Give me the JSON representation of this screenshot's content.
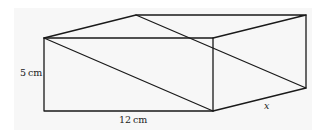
{
  "diagram": {
    "type": "cuboid",
    "labels": {
      "height": "5 cm",
      "length": "12 cm",
      "depth": "x"
    },
    "colors": {
      "stroke": "#1a1a1a",
      "background": "#f7f7f7"
    },
    "vertices": {
      "front_top_left": [
        44,
        38
      ],
      "front_top_right": [
        213,
        38
      ],
      "front_bottom_left": [
        44,
        111
      ],
      "front_bottom_right": [
        213,
        111
      ],
      "back_top_left": [
        136,
        15
      ],
      "back_top_right": [
        306,
        15
      ],
      "back_bottom_right": [
        306,
        88
      ]
    },
    "diagonals": [
      {
        "from": "front_top_left",
        "to": "front_bottom_right"
      },
      {
        "from": "back_top_left",
        "to": "back_bottom_right"
      }
    ]
  }
}
